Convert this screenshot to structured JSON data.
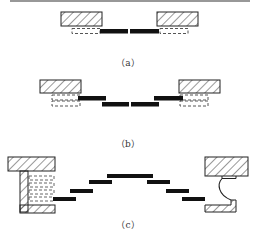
{
  "colors": {
    "ink": "#1a1a1a",
    "hatch": "#333333",
    "dash": "#555555",
    "background": "#ffffff"
  },
  "panels": [
    {
      "id": "a",
      "caption": "（a）",
      "caption_pos": [
        128,
        56
      ]
    },
    {
      "id": "b",
      "caption": "（b）",
      "caption_pos": [
        128,
        137
      ]
    },
    {
      "id": "c",
      "caption": "（c）",
      "caption_pos": [
        128,
        218
      ]
    }
  ]
}
